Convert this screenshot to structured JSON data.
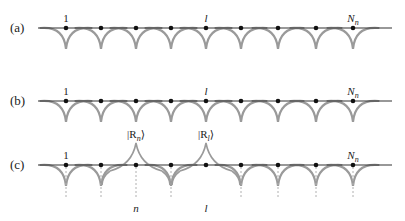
{
  "figure": {
    "rows": [
      {
        "id": "a",
        "label": "(a)",
        "line_y": 28,
        "first_site_label": "1",
        "mid_site_label": "l",
        "last_site_label": "N",
        "last_site_sub": "n",
        "peaks": [],
        "dashed": false
      },
      {
        "id": "b",
        "label": "(b)",
        "line_y": 101,
        "first_site_label": "1",
        "mid_site_label": "l",
        "last_site_label": "N",
        "last_site_sub": "n",
        "peaks": [],
        "dashed": false
      },
      {
        "id": "c",
        "label": "(c)",
        "line_y": 165,
        "first_site_label": "1",
        "last_site_label": "N",
        "last_site_sub": "n",
        "peaks": [
          {
            "site_index": 2,
            "ket": "|R",
            "ket_sub": "n",
            "ket_close": "⟩",
            "bottom_label": "n"
          },
          {
            "site_index": 4,
            "ket": "|R",
            "ket_sub": "l",
            "ket_close": "⟩",
            "bottom_label": "l"
          }
        ],
        "dashed": true
      }
    ],
    "site_x": [
      66,
      101,
      136,
      171,
      206,
      241,
      278,
      316,
      353
    ],
    "line_x_start": 38,
    "line_x_end": 392,
    "colors": {
      "line": "#333333",
      "arc": "#9a9a9a",
      "dot": "#111111",
      "dash": "#b0b0b0"
    }
  }
}
